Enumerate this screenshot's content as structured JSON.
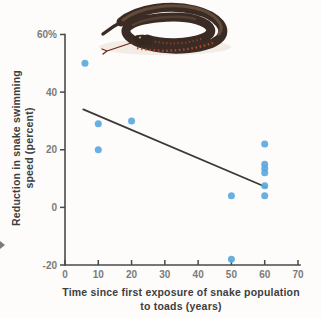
{
  "figure": {
    "background": "#fdfcfa"
  },
  "decorations": {
    "snake_illustration": "coiled-red-bellied-black-snake-image",
    "edge_mark": "cropped-page-arrow-fragment"
  },
  "chart_data": {
    "type": "scatter",
    "title": "",
    "xlabel_line1": "Time since first exposure of snake population",
    "xlabel_line2": "to toads (years)",
    "ylabel_line1": "Reduction in snake swimming",
    "ylabel_line2": "speed (percent)",
    "xlim": [
      0,
      70
    ],
    "ylim": [
      -20,
      60
    ],
    "grid": false,
    "legend": "none",
    "x_ticks": {
      "values": [
        0,
        10,
        20,
        30,
        40,
        50,
        60,
        70
      ],
      "labels": [
        "0",
        "10",
        "20",
        "30",
        "40",
        "50",
        "60",
        "70"
      ]
    },
    "y_ticks": {
      "values": [
        -20,
        0,
        20,
        40,
        60
      ],
      "labels": [
        "-20",
        "0",
        "20",
        "40",
        "60%"
      ]
    },
    "series": [
      {
        "name": "snake populations",
        "color": "#5BA8E0",
        "point_radius": 3.5,
        "points": [
          {
            "x": 6,
            "y": 50
          },
          {
            "x": 10,
            "y": 29
          },
          {
            "x": 10,
            "y": 20
          },
          {
            "x": 20,
            "y": 30
          },
          {
            "x": 50,
            "y": 4
          },
          {
            "x": 50,
            "y": -18
          },
          {
            "x": 60,
            "y": 22
          },
          {
            "x": 60,
            "y": 15
          },
          {
            "x": 60,
            "y": 13.5
          },
          {
            "x": 60,
            "y": 12
          },
          {
            "x": 60,
            "y": 7.5
          },
          {
            "x": 60,
            "y": 4
          }
        ]
      }
    ],
    "trend_line": {
      "x1": 5.5,
      "y1": 34,
      "x2": 60.5,
      "y2": 7,
      "color": "#3a3a3a",
      "width": 1.8
    },
    "colors": {
      "axis": "#4a4a4a",
      "tick_label": "#7b7b7b",
      "axis_title": "#3e3e3e",
      "point": "#5BA8E0"
    }
  }
}
